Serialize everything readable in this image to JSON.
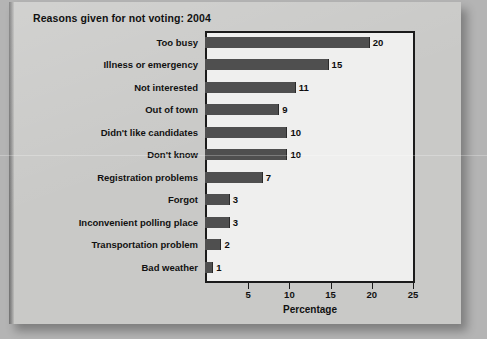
{
  "chart_data": {
    "type": "bar",
    "orientation": "horizontal",
    "title": "Reasons given for not voting: 2004",
    "xlabel": "Percentage",
    "ylabel": "",
    "categories": [
      "Too busy",
      "Illness or emergency",
      "Not interested",
      "Out of town",
      "Didn't like candidates",
      "Don't know",
      "Registration problems",
      "Forgot",
      "Inconvenient polling place",
      "Transportation problem",
      "Bad weather"
    ],
    "values": [
      20,
      15,
      11,
      9,
      10,
      10,
      7,
      3,
      3,
      2,
      1
    ],
    "value_labels": [
      "20",
      "15",
      "11",
      "9",
      "10",
      "10",
      "7",
      "3",
      "3",
      "2",
      "1"
    ],
    "xlim": [
      0,
      25
    ],
    "xticks": [
      5,
      10,
      15,
      20,
      25
    ],
    "xtick_labels": [
      "5",
      "10",
      "15",
      "20",
      "25"
    ],
    "grid": false,
    "legend": null,
    "bar_color": "#4f4f4f",
    "plot_background": "#efefee",
    "page_background": "#c9c9c7",
    "axis_color": "#1b1b1b"
  }
}
